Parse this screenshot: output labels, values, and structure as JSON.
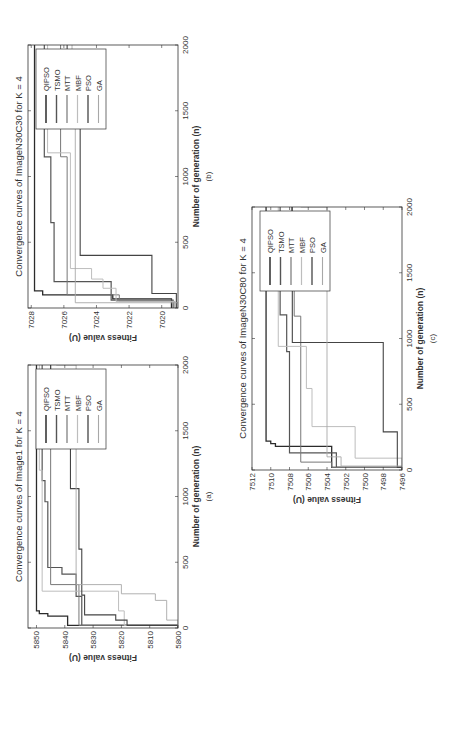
{
  "figure": {
    "orientation": "rotated 90 degrees counter-clockwise",
    "panels": [
      "(a)",
      "(b)",
      "(c)"
    ]
  },
  "series_styles": [
    {
      "name": "QIPSO",
      "color": "#2b2b2b",
      "width": 1.3
    },
    {
      "name": "TSMO",
      "color": "#555555",
      "width": 1.2
    },
    {
      "name": "MTT",
      "color": "#777777",
      "width": 1.0
    },
    {
      "name": "MBF",
      "color": "#bdbdbd",
      "width": 1.0
    },
    {
      "name": "PSO",
      "color": "#444444",
      "width": 1.1
    },
    {
      "name": "GA",
      "color": "#a8a8a8",
      "width": 0.9
    }
  ],
  "chart_data": [
    {
      "id": "a",
      "type": "line",
      "title": "Convergence curves of Image1 for K = 4",
      "xlabel": "Number of generation (n)",
      "ylabel": "Fitness value (U)",
      "caption": "(a)",
      "xlim": [
        0,
        2000
      ],
      "ylim": [
        5800,
        5853
      ],
      "xticks": [
        0,
        500,
        1000,
        1500,
        2000
      ],
      "yticks": [
        5800,
        5810,
        5820,
        5830,
        5840,
        5850
      ],
      "legend": [
        "QIPSO",
        "TSMO",
        "MTT",
        "MBF",
        "PSO",
        "GA"
      ],
      "legend_position": "upper right",
      "step": true,
      "series": [
        {
          "name": "QIPSO",
          "x": [
            0,
            20,
            60,
            90,
            110,
            130,
            2000
          ],
          "y": [
            5800,
            5839,
            5839,
            5846,
            5849,
            5850,
            5850
          ]
        },
        {
          "name": "TSMO",
          "x": [
            0,
            20,
            240,
            410,
            460,
            960,
            1120,
            2000
          ],
          "y": [
            5800,
            5834,
            5836,
            5841,
            5846,
            5847,
            5848,
            5848
          ]
        },
        {
          "name": "MTT",
          "x": [
            0,
            20,
            330,
            2000
          ],
          "y": [
            5800,
            5835,
            5845,
            5845
          ]
        },
        {
          "name": "MBF",
          "x": [
            0,
            20,
            130,
            280,
            1200,
            2000
          ],
          "y": [
            5800,
            5819,
            5821,
            5848,
            5849,
            5849
          ]
        },
        {
          "name": "PSO",
          "x": [
            0,
            20,
            60,
            100,
            250,
            600,
            1060,
            1620,
            1680,
            2000
          ],
          "y": [
            5800,
            5818,
            5822,
            5833,
            5834,
            5835,
            5838,
            5842,
            5845,
            5845
          ]
        },
        {
          "name": "GA",
          "x": [
            0,
            60,
            210,
            260,
            330,
            2000
          ],
          "y": [
            5800,
            5804,
            5808,
            5820,
            5836,
            5843
          ]
        }
      ]
    },
    {
      "id": "b",
      "type": "line",
      "title": "Convergence curves of ImageN30C30 for K = 4",
      "xlabel": "Number of generation (n)",
      "ylabel": "Fitness value (U)",
      "caption": "(b)",
      "xlim": [
        0,
        2000
      ],
      "ylim": [
        7019,
        7028.2
      ],
      "xticks": [
        0,
        500,
        1000,
        1500,
        2000
      ],
      "yticks": [
        7020,
        7022,
        7024,
        7026,
        7028
      ],
      "legend": [
        "QIPSO",
        "TSMO",
        "MTT",
        "MBF",
        "PSO",
        "GA"
      ],
      "legend_position": "upper right",
      "step": true,
      "series": [
        {
          "name": "QIPSO",
          "x": [
            0,
            70,
            100,
            130,
            2000
          ],
          "y": [
            7019.4,
            7023,
            7027.3,
            7027.8,
            7027.8
          ]
        },
        {
          "name": "TSMO",
          "x": [
            0,
            60,
            200,
            650,
            1150,
            2000
          ],
          "y": [
            7019.3,
            7023.1,
            7026.6,
            7026.8,
            7027.2,
            7027.2
          ]
        },
        {
          "name": "MTT",
          "x": [
            0,
            50,
            100,
            1150,
            2000
          ],
          "y": [
            7019.2,
            7022.6,
            7025.8,
            7026.2,
            7026.2
          ]
        },
        {
          "name": "MBF",
          "x": [
            0,
            50,
            150,
            220,
            300,
            1180,
            2000
          ],
          "y": [
            7019.2,
            7022.8,
            7023.6,
            7024.3,
            7025.6,
            7027,
            7027
          ]
        },
        {
          "name": "PSO",
          "x": [
            0,
            110,
            400,
            1700,
            2000
          ],
          "y": [
            7019.1,
            7020.6,
            7025,
            7025.8,
            7025.8
          ]
        },
        {
          "name": "GA",
          "x": [
            0,
            40,
            1750,
            2000
          ],
          "y": [
            7019,
            7025.3,
            7025.5,
            7025.5
          ]
        }
      ]
    },
    {
      "id": "c",
      "type": "line",
      "title": "Convergence curves of ImageN30C80 for K = 4",
      "xlabel": "Number of generation (n)",
      "ylabel": "Fitness value (U)",
      "caption": "(c)",
      "xlim": [
        0,
        2000
      ],
      "ylim": [
        7496,
        7512
      ],
      "xticks": [
        0,
        500,
        1000,
        1500,
        2000
      ],
      "yticks": [
        7496,
        7498,
        7500,
        7502,
        7504,
        7506,
        7508,
        7510,
        7512
      ],
      "legend": [
        "QIPSO",
        "TSMO",
        "MTT",
        "MBF",
        "PSO",
        "GA"
      ],
      "legend_position": "upper right",
      "step": true,
      "series": [
        {
          "name": "QIPSO",
          "x": [
            0,
            20,
            180,
            200,
            220,
            2000
          ],
          "y": [
            7496,
            7503.5,
            7509.5,
            7510,
            7510.5,
            7510.5
          ]
        },
        {
          "name": "TSMO",
          "x": [
            0,
            20,
            130,
            900,
            1180,
            2000
          ],
          "y": [
            7496,
            7503,
            7508,
            7508.3,
            7509,
            7509
          ]
        },
        {
          "name": "MTT",
          "x": [
            0,
            20,
            60,
            1170,
            1580,
            2000
          ],
          "y": [
            7496,
            7503.5,
            7506.8,
            7507.5,
            7507.8,
            7507.8
          ]
        },
        {
          "name": "MBF",
          "x": [
            0,
            90,
            330,
            620,
            940,
            2000
          ],
          "y": [
            7496,
            7501,
            7505.6,
            7506.2,
            7509.2,
            7509.2
          ]
        },
        {
          "name": "PSO",
          "x": [
            0,
            20,
            290,
            970,
            2000
          ],
          "y": [
            7496,
            7496.5,
            7498,
            7507.7,
            7507.7
          ]
        },
        {
          "name": "GA",
          "x": [
            0,
            30,
            100,
            2000
          ],
          "y": [
            7496,
            7502.5,
            7504,
            7506.8
          ]
        }
      ]
    }
  ]
}
